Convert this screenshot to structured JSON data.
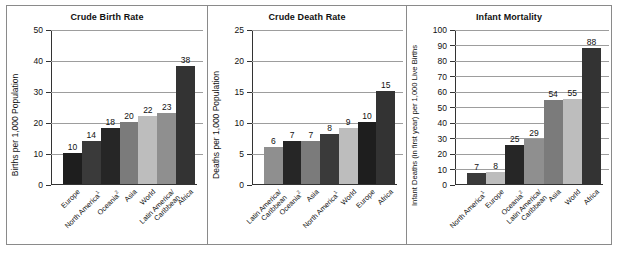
{
  "figure": {
    "panels": [
      {
        "id": "crude-birth-rate",
        "title": "Crude Birth Rate",
        "ylabel": "Births per 1,000 Population"
      },
      {
        "id": "crude-death-rate",
        "title": "Crude Death Rate",
        "ylabel": "Deaths per 1,000 Population"
      },
      {
        "id": "infant-mortality",
        "title": "Infant Mortality",
        "ylabel": "Infant Deaths (in first year) per 1,000 Live Births"
      }
    ]
  },
  "colors": {
    "europe": "#1e1e1e",
    "north_america": "#3a3a3a",
    "oceania": "#262626",
    "asia": "#7b7b7b",
    "world": "#bdbdbd",
    "latin_america": "#8f8f8f",
    "africa": "#333333",
    "gridline": "#9d9d9d",
    "axis": "#333333",
    "frame": "#8a8a8a",
    "background": "#ffffff",
    "text": "#111111"
  },
  "chart_data": [
    {
      "type": "bar",
      "title": "Crude Birth Rate",
      "xlabel": "",
      "ylabel": "Births per 1,000 Population",
      "ylim": [
        0,
        50
      ],
      "yticks": [
        0,
        10,
        20,
        30,
        40,
        50
      ],
      "grid": true,
      "legend": "none",
      "categories": [
        "Europe",
        "North America¹",
        "Oceania²",
        "Asia",
        "World",
        "Latin America/\nCaribbean",
        "Africa"
      ],
      "category_labels": [
        {
          "line1": "Europe",
          "sup": ""
        },
        {
          "line1": "North America",
          "sup": "1"
        },
        {
          "line1": "Oceania",
          "sup": "2"
        },
        {
          "line1": "Asia",
          "sup": ""
        },
        {
          "line1": "World",
          "sup": ""
        },
        {
          "line1": "Latin America/",
          "line2": "Caribbean",
          "sup": ""
        },
        {
          "line1": "Africa",
          "sup": ""
        }
      ],
      "values": [
        10,
        14,
        18,
        20,
        22,
        23,
        38
      ],
      "bar_colors": [
        "#1e1e1e",
        "#3a3a3a",
        "#262626",
        "#7b7b7b",
        "#bdbdbd",
        "#8f8f8f",
        "#333333"
      ]
    },
    {
      "type": "bar",
      "title": "Crude Death Rate",
      "xlabel": "",
      "ylabel": "Deaths per 1,000 Population",
      "ylim": [
        0,
        25
      ],
      "yticks": [
        0,
        5,
        10,
        15,
        20,
        25
      ],
      "grid": true,
      "legend": "none",
      "categories": [
        "Latin America/\nCaribbean",
        "Oceania²",
        "Asia",
        "North America¹",
        "World",
        "Europe",
        "Africa"
      ],
      "category_labels": [
        {
          "line1": "Latin America/",
          "line2": "Caribbean",
          "sup": ""
        },
        {
          "line1": "Oceania",
          "sup": "2"
        },
        {
          "line1": "Asia",
          "sup": ""
        },
        {
          "line1": "North America",
          "sup": "1"
        },
        {
          "line1": "World",
          "sup": ""
        },
        {
          "line1": "Europe",
          "sup": ""
        },
        {
          "line1": "Africa",
          "sup": ""
        }
      ],
      "values": [
        6,
        7,
        7,
        8,
        9,
        10,
        15
      ],
      "bar_colors": [
        "#8f8f8f",
        "#262626",
        "#7b7b7b",
        "#3a3a3a",
        "#bdbdbd",
        "#1e1e1e",
        "#333333"
      ]
    },
    {
      "type": "bar",
      "title": "Infant Mortality",
      "xlabel": "",
      "ylabel": "Infant Deaths (in first year) per 1,000 Live Births",
      "ylim": [
        0,
        100
      ],
      "yticks": [
        0,
        10,
        20,
        30,
        40,
        50,
        60,
        70,
        80,
        90,
        100
      ],
      "grid": true,
      "legend": "none",
      "categories": [
        "North America¹",
        "Europe",
        "Oceania²",
        "Latin America/\nCaribbean",
        "Asia",
        "World",
        "Africa"
      ],
      "category_labels": [
        {
          "line1": "North America",
          "sup": "1"
        },
        {
          "line1": "Europe",
          "sup": ""
        },
        {
          "line1": "Oceania",
          "sup": "2"
        },
        {
          "line1": "Latin America/",
          "line2": "Caribbean",
          "sup": ""
        },
        {
          "line1": "Asia",
          "sup": ""
        },
        {
          "line1": "World",
          "sup": ""
        },
        {
          "line1": "Africa",
          "sup": ""
        }
      ],
      "values": [
        7,
        8,
        25,
        29,
        54,
        55,
        88
      ],
      "bar_colors": [
        "#3a3a3a",
        "#bdbdbd",
        "#262626",
        "#8f8f8f",
        "#7b7b7b",
        "#bdbdbd",
        "#333333"
      ]
    }
  ]
}
